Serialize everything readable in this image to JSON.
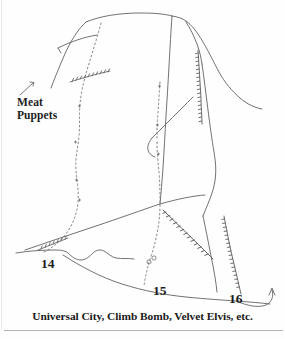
{
  "figure": {
    "type": "climbing-topo-diagram",
    "caption": "Universal City, Climb Bomb, Velvet Elvis, etc.",
    "background_color": "#fefefe",
    "ink_color": "#4a4a4a",
    "text_color": "#1a1a1a"
  },
  "annotations": {
    "meat_puppets": {
      "line1": "Meat",
      "line2": "Puppets"
    }
  },
  "routes": [
    {
      "number": "14",
      "label": "14"
    },
    {
      "number": "15",
      "label": "15"
    },
    {
      "number": "16",
      "label": "16"
    }
  ],
  "icons": {
    "leader_line": "leader-line-icon",
    "approach_arrow": "arrow-icon"
  }
}
